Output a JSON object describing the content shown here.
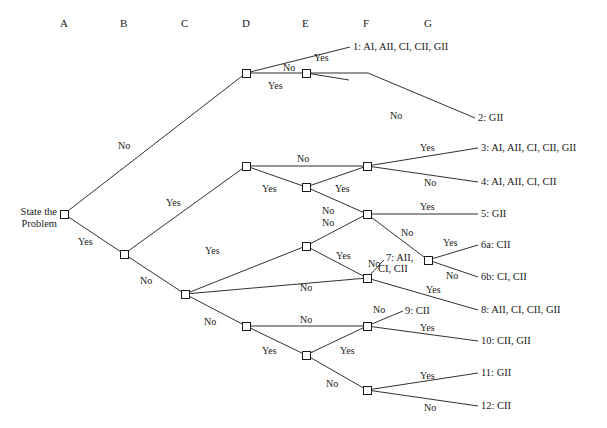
{
  "columns": [
    {
      "label": "A",
      "x": 64
    },
    {
      "label": "B",
      "x": 124
    },
    {
      "label": "C",
      "x": 185
    },
    {
      "label": "D",
      "x": 246
    },
    {
      "label": "E",
      "x": 306
    },
    {
      "label": "F",
      "x": 367
    },
    {
      "label": "G",
      "x": 428
    }
  ],
  "start": {
    "line1": "State the",
    "line2": "Problem"
  },
  "nodes": [
    {
      "id": "A",
      "x": 64,
      "y": 214
    },
    {
      "id": "B",
      "x": 124,
      "y": 254
    },
    {
      "id": "C",
      "x": 185,
      "y": 294
    },
    {
      "id": "D1",
      "x": 246,
      "y": 73
    },
    {
      "id": "D2",
      "x": 246,
      "y": 166
    },
    {
      "id": "D3",
      "x": 246,
      "y": 326
    },
    {
      "id": "E1",
      "x": 306,
      "y": 73
    },
    {
      "id": "E2",
      "x": 306,
      "y": 187
    },
    {
      "id": "E3",
      "x": 306,
      "y": 246
    },
    {
      "id": "E4",
      "x": 306,
      "y": 355
    },
    {
      "id": "F1",
      "x": 367,
      "y": 166
    },
    {
      "id": "F2",
      "x": 367,
      "y": 214
    },
    {
      "id": "F3",
      "x": 367,
      "y": 278
    },
    {
      "id": "F4",
      "x": 367,
      "y": 326
    },
    {
      "id": "F5",
      "x": 367,
      "y": 390
    },
    {
      "id": "G1",
      "x": 428,
      "y": 260
    }
  ],
  "edges": [
    {
      "from": "A",
      "to": "D1",
      "label": "No",
      "lx": 118,
      "ly": 140
    },
    {
      "from": "A",
      "to": "B",
      "label": "Yes",
      "lx": 78,
      "ly": 236
    },
    {
      "from": "B",
      "to": "D2",
      "label": "Yes",
      "lx": 166,
      "ly": 197
    },
    {
      "from": "B",
      "to": "C",
      "label": "No",
      "lx": 140,
      "ly": 275
    },
    {
      "from": "C",
      "to": "E3",
      "label": "Yes",
      "lx": 205,
      "ly": 245
    },
    {
      "from": "C",
      "to": "D3",
      "label": "No",
      "lx": 204,
      "ly": 316
    },
    {
      "from": "D1",
      "to": "O1",
      "label": "No",
      "lx": 283,
      "ly": 62
    },
    {
      "from": "D1",
      "to": "E1",
      "label": "Yes",
      "lx": 268,
      "ly": 80
    },
    {
      "from": "E1",
      "to": "YESSTUB",
      "label": "Yes",
      "lx": 314,
      "ly": 52
    },
    {
      "from": "E1",
      "to": "O2",
      "label": "No",
      "lx": 390,
      "ly": 110
    },
    {
      "from": "D2",
      "to": "F1",
      "label": "No",
      "lx": 297,
      "ly": 153
    },
    {
      "from": "D2",
      "to": "E2",
      "label": "Yes",
      "lx": 262,
      "ly": 183
    },
    {
      "from": "E2",
      "to": "F1",
      "label": "Yes",
      "lx": 335,
      "ly": 183
    },
    {
      "from": "E2",
      "to": "F2",
      "label": "No",
      "lx": 322,
      "ly": 205
    },
    {
      "from": "F1",
      "to": "O3",
      "label": "Yes",
      "lx": 420,
      "ly": 142
    },
    {
      "from": "F1",
      "to": "O4",
      "label": "No",
      "lx": 424,
      "ly": 177
    },
    {
      "from": "F2",
      "to": "O5",
      "label": "Yes",
      "lx": 420,
      "ly": 201
    },
    {
      "from": "F2",
      "to": "G1",
      "label": "No",
      "lx": 401,
      "ly": 227
    },
    {
      "from": "E3",
      "to": "F2",
      "label": "No",
      "lx": 322,
      "ly": 217
    },
    {
      "from": "E3",
      "to": "F3",
      "label": "Yes",
      "lx": 336,
      "ly": 250
    },
    {
      "from": "C",
      "to": "F3",
      "label": "No",
      "lx": 300,
      "ly": 282
    },
    {
      "from": "D3",
      "to": "E4",
      "label": "Yes",
      "lx": 262,
      "ly": 345
    },
    {
      "from": "D3",
      "to": "F4",
      "label": "No",
      "lx": 300,
      "ly": 314
    },
    {
      "from": "E4",
      "to": "F4",
      "label": "Yes",
      "lx": 340,
      "ly": 345
    },
    {
      "from": "E4",
      "to": "F5",
      "label": "No",
      "lx": 326,
      "ly": 378
    },
    {
      "from": "F3",
      "to": "O7",
      "label": "No",
      "lx": 368,
      "ly": 258
    },
    {
      "from": "F3",
      "to": "O8",
      "label": "Yes",
      "lx": 426,
      "ly": 284
    },
    {
      "from": "G1",
      "to": "O6a",
      "label": "Yes",
      "lx": 443,
      "ly": 237
    },
    {
      "from": "G1",
      "to": "O6b",
      "label": "No",
      "lx": 446,
      "ly": 270
    },
    {
      "from": "F4",
      "to": "O9",
      "label": "No",
      "lx": 373,
      "ly": 304
    },
    {
      "from": "F4",
      "to": "O10",
      "label": "Yes",
      "lx": 420,
      "ly": 322
    },
    {
      "from": "F5",
      "to": "O11",
      "label": "Yes",
      "lx": 420,
      "ly": 370
    },
    {
      "from": "F5",
      "to": "O12",
      "label": "No",
      "lx": 424,
      "ly": 402
    }
  ],
  "outcomes": [
    {
      "id": "O1",
      "text": "1:  AI, AII, CI, CII, GII",
      "x": 353,
      "y": 47,
      "ax": 350,
      "ay": 47
    },
    {
      "id": "O2",
      "text": "2: GII",
      "x": 478,
      "y": 118,
      "ax": 475,
      "ay": 118
    },
    {
      "id": "O3",
      "text": "3: AI, AII, CI, CII, GII",
      "x": 481,
      "y": 148,
      "ax": 478,
      "ay": 148
    },
    {
      "id": "O4",
      "text": "4: AI, AII, CI, CII",
      "x": 481,
      "y": 182,
      "ax": 478,
      "ay": 182
    },
    {
      "id": "O5",
      "text": "5: GII",
      "x": 481,
      "y": 214,
      "ax": 478,
      "ay": 214
    },
    {
      "id": "O6a",
      "text": "6a: CII",
      "x": 481,
      "y": 245,
      "ax": 478,
      "ay": 245
    },
    {
      "id": "O6b",
      "text": "6b: CI, CII",
      "x": 481,
      "y": 277,
      "ax": 478,
      "ay": 277
    },
    {
      "id": "O7",
      "text": "7: AII,",
      "text2": "CI, CII",
      "x": 386,
      "y": 258,
      "ax": 384,
      "ay": 260
    },
    {
      "id": "O8",
      "text": "8: AII, CI, CII, GII",
      "x": 481,
      "y": 310,
      "ax": 478,
      "ay": 310
    },
    {
      "id": "O9",
      "text": "9: CII",
      "x": 405,
      "y": 311,
      "ax": 403,
      "ay": 311
    },
    {
      "id": "O10",
      "text": "10: CII, GII",
      "x": 481,
      "y": 341,
      "ax": 478,
      "ay": 341
    },
    {
      "id": "O11",
      "text": "11: GII",
      "x": 481,
      "y": 373,
      "ax": 478,
      "ay": 373
    },
    {
      "id": "O12",
      "text": "12: CII",
      "x": 481,
      "y": 406,
      "ax": 478,
      "ay": 406
    }
  ],
  "stub": {
    "id": "YESSTUB",
    "x": 349,
    "y": 80
  },
  "colors": {
    "ink": "#1a1a1a",
    "background": "#ffffff"
  }
}
